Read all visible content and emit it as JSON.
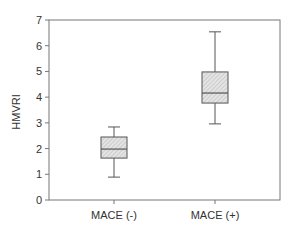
{
  "chart_data": {
    "type": "box",
    "title": "",
    "xlabel": "",
    "ylabel": "HMVRI",
    "ylim": [
      0,
      7
    ],
    "yticks": [
      0,
      1,
      2,
      3,
      4,
      5,
      6,
      7
    ],
    "grid": false,
    "legend": null,
    "categories": [
      "MACE (-)",
      "MACE (+)"
    ],
    "boxes": [
      {
        "label": "MACE (-)",
        "whisker_low": 0.89,
        "q1": 1.63,
        "median": 1.98,
        "q3": 2.45,
        "whisker_high": 2.84
      },
      {
        "label": "MACE (+)",
        "whisker_low": 2.96,
        "q1": 3.77,
        "median": 4.16,
        "q3": 4.98,
        "whisker_high": 6.54
      }
    ],
    "box_fill": "#d9d9d9",
    "box_pattern": "hatched",
    "line_color": "#555555"
  }
}
